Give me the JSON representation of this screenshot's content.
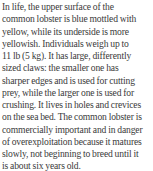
{
  "document": {
    "lines": [
      "In life, the upper surface of the",
      "common lobster is blue mottled with",
      "yellow, while its underside is more",
      "yellowish. Individuals weigh up to",
      "11 lb (5 kg). It has large, differently",
      "sized claws: the smaller one has",
      "sharper edges and is used for cutting",
      "prey, while the larger one is used for",
      "crushing. It lives in holes and crevices",
      "on the sea bed. The common lobster is",
      "commercially important and in danger",
      "of overexploitation because it matures",
      "slowly, not beginning to breed until it",
      "is about six years old."
    ]
  }
}
